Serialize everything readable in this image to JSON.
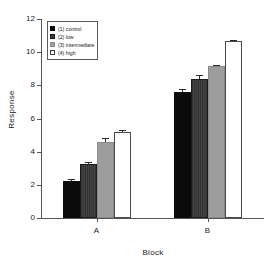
{
  "chart_data": {
    "type": "bar",
    "title": "",
    "xlabel": "Block",
    "ylabel": "Response",
    "categories": [
      "A",
      "B"
    ],
    "ylim": [
      0,
      12
    ],
    "yticks": [
      0,
      2,
      4,
      6,
      8,
      10,
      12
    ],
    "grid": false,
    "legend_position": "top-left",
    "series": [
      {
        "name": "(1) control",
        "color": "#0b0b0b",
        "values": [
          2.25,
          7.6
        ],
        "errors": [
          0.12,
          0.18
        ]
      },
      {
        "name": "(2) low",
        "color": "#3b3b3b",
        "values": [
          3.25,
          8.4
        ],
        "errors": [
          0.1,
          0.25
        ]
      },
      {
        "name": "(3) intermediate",
        "color": "#9d9d9d",
        "values": [
          4.6,
          9.15
        ],
        "errors": [
          0.22,
          0.1
        ]
      },
      {
        "name": "(4) high",
        "color": "#ffffff",
        "values": [
          5.2,
          10.65
        ],
        "errors": [
          0.12,
          0.07
        ]
      }
    ]
  },
  "legend": {
    "items": [
      {
        "label": "(1) control"
      },
      {
        "label": "(2) low"
      },
      {
        "label": "(3) intermediate"
      },
      {
        "label": "(4) high"
      }
    ]
  }
}
